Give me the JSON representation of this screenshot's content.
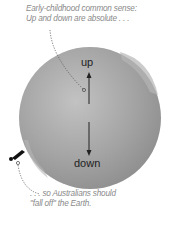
{
  "captions": {
    "top_line1": "Early-childhood common sense:",
    "top_line2": "Up and down are absolute . . .",
    "bottom_line1": ". . . so Australians should",
    "bottom_line2": "\"fall off\" the Earth."
  },
  "labels": {
    "up": "up",
    "down": "down"
  },
  "colors": {
    "globe": "#9a9a9a",
    "globe_highlight": "#c4c4c4",
    "caption": "#8a8a8a",
    "arrow": "#222222"
  },
  "icons": {
    "person": "falling-person-icon"
  }
}
